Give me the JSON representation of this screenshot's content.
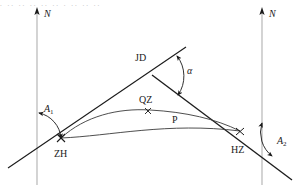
{
  "figure": {
    "type": "route-curve-geometry-diagram",
    "background_color": "#ffffff",
    "line_color": "#1a1a1a",
    "axis_color": "#b0b0b0",
    "curve_color": "#3a3a3a",
    "cropped_top_text": ". .. .. .. ..  .. . ..   .. ..",
    "labels": {
      "north_left": "N",
      "north_right": "N",
      "azimuth_start": "A",
      "azimuth_start_sub": "1",
      "azimuth_end": "A",
      "azimuth_end_sub": "2",
      "deflection_angle": "α",
      "intersection_point": "JD",
      "curve_midpoint": "QZ",
      "point_p": "P",
      "start_of_spiral": "ZH",
      "end_of_spiral": "HZ"
    },
    "points": {
      "ZH": {
        "x": 61,
        "y": 138,
        "marker": "cross"
      },
      "HZ": {
        "x": 240,
        "y": 131,
        "marker": "cross"
      },
      "QZ": {
        "x": 148,
        "y": 111,
        "marker": "cross"
      },
      "JD": {
        "x": 152,
        "y": 75,
        "marker": "none"
      },
      "P": {
        "x": 175,
        "y": 118,
        "marker": "none"
      }
    },
    "axes": [
      {
        "name": "north-axis-left",
        "x": 37,
        "y_top": 9,
        "y_bottom": 185
      },
      {
        "name": "north-axis-right",
        "x": 262,
        "y_top": 9,
        "y_bottom": 185
      }
    ],
    "angle_arcs": [
      {
        "name": "A1",
        "vertex": "ZH",
        "arrowheads": 2
      },
      {
        "name": "alpha",
        "vertex": "JD",
        "arrowheads": 2
      },
      {
        "name": "A2",
        "vertex": "HZ",
        "arrowheads": 2
      }
    ]
  }
}
